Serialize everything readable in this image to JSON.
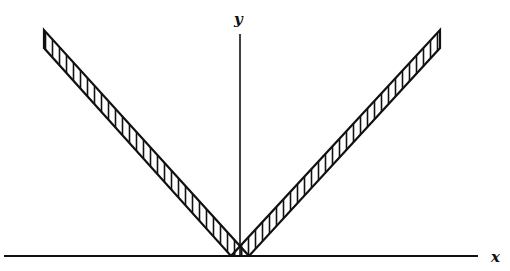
{
  "diagram": {
    "axes": {
      "x_label": "x",
      "y_label": "y"
    },
    "bands": [
      {
        "name": "left-band",
        "hatch": "vertical lines"
      },
      {
        "name": "right-band",
        "hatch": "vertical lines"
      }
    ],
    "colors": {
      "stroke": "#111111",
      "background": "#ffffff"
    }
  }
}
